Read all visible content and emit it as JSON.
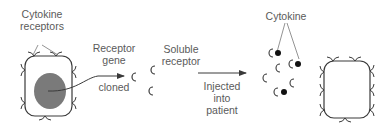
{
  "diagram": {
    "labels": {
      "cytokine_receptors_line1": "Cytokine",
      "cytokine_receptors_line2": "receptors",
      "receptor_gene_line1": "Receptor",
      "receptor_gene_line2": "gene",
      "cloned": "cloned",
      "soluble_receptor_line1": "Soluble",
      "soluble_receptor_line2": "receptor",
      "injected_line1": "Injected",
      "injected_line2": "into",
      "injected_line3": "patient",
      "cytokine": "Cytokine"
    },
    "colors": {
      "line": "#3a3a3a",
      "nucleus": "#7a7a7a",
      "text": "#5a5a5a",
      "cytokine_dot": "#111111"
    },
    "elements": [
      "cell-with-receptors-and-nucleus",
      "arrow-gene-cloned",
      "soluble-receptors",
      "arrow-injected",
      "cytokines-bound-to-soluble-receptors",
      "cell-with-receptors"
    ]
  }
}
